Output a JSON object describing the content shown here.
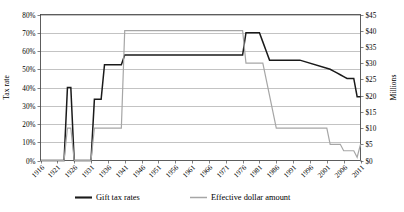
{
  "chart_data": {
    "type": "line",
    "title": "",
    "xlabel": "",
    "ylabel": "Tax rate",
    "y2label": "Millions",
    "xlim": [
      1916,
      2011
    ],
    "ylim": [
      0,
      0.8
    ],
    "y2lim": [
      0,
      45
    ],
    "grid": true,
    "legend_position": "bottom",
    "x_tick_labels": [
      "1916",
      "1921",
      "1926",
      "1931",
      "1936",
      "1941",
      "1946",
      "1951",
      "1956",
      "1961",
      "1966",
      "1971",
      "1976",
      "1981",
      "1986",
      "1991",
      "1996",
      "2001",
      "2006",
      "2011"
    ],
    "y_tick_labels": [
      "0%",
      "10%",
      "20%",
      "30%",
      "40%",
      "50%",
      "60%",
      "70%",
      "80%"
    ],
    "y2_tick_labels": [
      "$0",
      "$5",
      "$10",
      "$15",
      "$20",
      "$25",
      "$30",
      "$35",
      "$40",
      "$45"
    ],
    "series": [
      {
        "name": "Gift tax rates",
        "axis": "left",
        "color": "#1a1a1a",
        "unit": "fraction",
        "points": [
          [
            1916,
            0.0
          ],
          [
            1923,
            0.0
          ],
          [
            1924,
            0.4
          ],
          [
            1925,
            0.4
          ],
          [
            1926,
            0.0
          ],
          [
            1931,
            0.0
          ],
          [
            1932,
            0.335
          ],
          [
            1934,
            0.335
          ],
          [
            1935,
            0.525
          ],
          [
            1940,
            0.525
          ],
          [
            1941,
            0.5775
          ],
          [
            1976,
            0.5775
          ],
          [
            1977,
            0.7
          ],
          [
            1981,
            0.7
          ],
          [
            1982,
            0.65
          ],
          [
            1983,
            0.6
          ],
          [
            1984,
            0.55
          ],
          [
            1993,
            0.55
          ],
          [
            2002,
            0.5
          ],
          [
            2003,
            0.49
          ],
          [
            2004,
            0.48
          ],
          [
            2005,
            0.47
          ],
          [
            2006,
            0.46
          ],
          [
            2007,
            0.45
          ],
          [
            2008,
            0.45
          ],
          [
            2009,
            0.45
          ],
          [
            2010,
            0.35
          ],
          [
            2011,
            0.35
          ]
        ]
      },
      {
        "name": "Effective dollar amount",
        "axis": "right",
        "color": "#a6a6a6",
        "unit": "millions",
        "points": [
          [
            1916,
            0.0
          ],
          [
            1923,
            0.0
          ],
          [
            1924,
            10.0
          ],
          [
            1925,
            10.0
          ],
          [
            1926,
            0.0
          ],
          [
            1931,
            0.0
          ],
          [
            1932,
            10.0
          ],
          [
            1934,
            10.0
          ],
          [
            1935,
            10.0
          ],
          [
            1940,
            10.0
          ],
          [
            1941,
            40.0
          ],
          [
            1976,
            40.0
          ],
          [
            1977,
            30.0
          ],
          [
            1981,
            30.0
          ],
          [
            1982,
            30.0
          ],
          [
            1986,
            10.0
          ],
          [
            1987,
            10.0
          ],
          [
            1997,
            10.0
          ],
          [
            1998,
            10.0
          ],
          [
            2001,
            10.0
          ],
          [
            2002,
            5.0
          ],
          [
            2005,
            5.0
          ],
          [
            2006,
            3.0
          ],
          [
            2009,
            3.0
          ],
          [
            2010,
            1.0
          ],
          [
            2011,
            5.0
          ]
        ]
      }
    ],
    "legend": [
      {
        "label": "Gift tax rates",
        "color": "#1a1a1a"
      },
      {
        "label": "Effective dollar amount",
        "color": "#a6a6a6"
      }
    ]
  }
}
